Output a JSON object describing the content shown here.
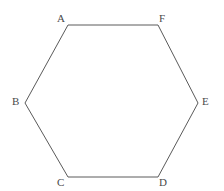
{
  "figure": {
    "name": "hexagon-with-labeled-vertices",
    "canvas": {
      "width": 224,
      "height": 191
    },
    "background_color": "#ffffff",
    "stroke_color": "#5a5a5a",
    "stroke_width": 1,
    "fill": "none",
    "label_color": "#4a4a4a"
  },
  "shape": {
    "type": "hexagon",
    "sides": 6,
    "points_attr": "68,25 158,25 198,103 158,177 68,177 25,103",
    "vertices": [
      {
        "id": "A",
        "x": 68,
        "y": 25
      },
      {
        "id": "F",
        "x": 158,
        "y": 25
      },
      {
        "id": "E",
        "x": 198,
        "y": 103
      },
      {
        "id": "D",
        "x": 158,
        "y": 177
      },
      {
        "id": "C",
        "x": 68,
        "y": 177
      },
      {
        "id": "B",
        "x": 25,
        "y": 103
      }
    ]
  },
  "labels": [
    {
      "id": "label-a",
      "text": "A",
      "left": 57,
      "top": 13
    },
    {
      "id": "label-f",
      "text": "F",
      "left": 159,
      "top": 13
    },
    {
      "id": "label-e",
      "text": "E",
      "left": 202,
      "top": 96
    },
    {
      "id": "label-d",
      "text": "D",
      "left": 159,
      "top": 177
    },
    {
      "id": "label-c",
      "text": "C",
      "left": 57,
      "top": 177
    },
    {
      "id": "label-b",
      "text": "B",
      "left": 12,
      "top": 96
    }
  ]
}
